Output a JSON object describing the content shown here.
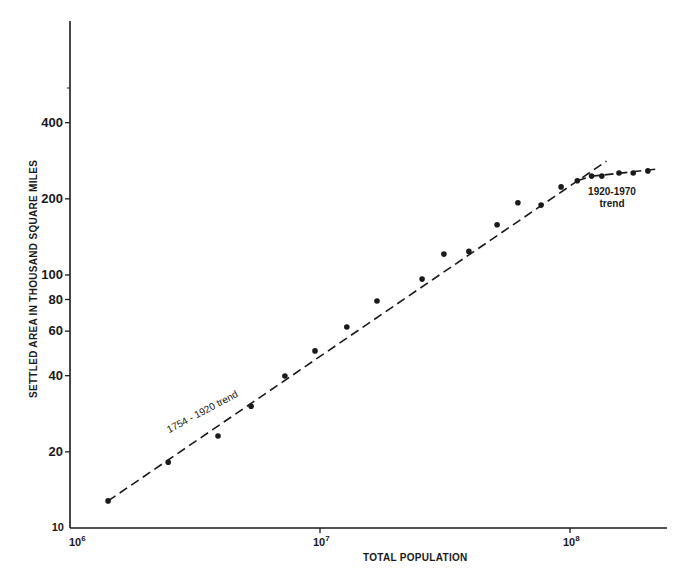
{
  "chart_data": {
    "type": "scatter",
    "title": "",
    "xlabel": "TOTAL POPULATION",
    "ylabel": "SETTLED AREA IN THOUSAND SQUARE MILES",
    "xscale": "log",
    "yscale": "log",
    "xlim": [
      1000000,
      250000000
    ],
    "ylim": [
      10,
      700
    ],
    "grid": false,
    "legend": null,
    "x_ticks": [
      {
        "value": 1000000,
        "base": "10",
        "exp": "6"
      },
      {
        "value": 10000000,
        "base": "10",
        "exp": "7"
      },
      {
        "value": 100000000,
        "base": "10",
        "exp": "8"
      }
    ],
    "y_ticks": [
      {
        "value": 10,
        "label": "10"
      },
      {
        "value": 20,
        "label": "20"
      },
      {
        "value": 40,
        "label": "40"
      },
      {
        "value": 60,
        "label": "60"
      },
      {
        "value": 80,
        "label": "80"
      },
      {
        "value": 100,
        "label": "100"
      },
      {
        "value": 200,
        "label": "200"
      },
      {
        "value": 400,
        "label": "400"
      }
    ],
    "series": [
      {
        "name": "Observations",
        "marker": "dot",
        "points": [
          {
            "x": 1420000,
            "y": 12.8
          },
          {
            "x": 2470000,
            "y": 18.2
          },
          {
            "x": 3910000,
            "y": 23.1
          },
          {
            "x": 5300000,
            "y": 30.3
          },
          {
            "x": 7240000,
            "y": 39.9
          },
          {
            "x": 9550000,
            "y": 50.1
          },
          {
            "x": 12800000,
            "y": 62.3
          },
          {
            "x": 16900000,
            "y": 78.9
          },
          {
            "x": 25600000,
            "y": 96.3
          },
          {
            "x": 31300000,
            "y": 121
          },
          {
            "x": 39400000,
            "y": 124
          },
          {
            "x": 51100000,
            "y": 158
          },
          {
            "x": 61900000,
            "y": 193
          },
          {
            "x": 76600000,
            "y": 189
          },
          {
            "x": 92100000,
            "y": 223
          },
          {
            "x": 107000000,
            "y": 236
          },
          {
            "x": 122000000,
            "y": 246
          },
          {
            "x": 134000000,
            "y": 246
          },
          {
            "x": 157000000,
            "y": 253
          },
          {
            "x": 179000000,
            "y": 253
          },
          {
            "x": 205000000,
            "y": 258
          }
        ]
      },
      {
        "name": "1754 - 1920 trend",
        "style": "dashed",
        "points": [
          {
            "x": 1420000,
            "y": 12.8
          },
          {
            "x": 140000000,
            "y": 282
          }
        ]
      },
      {
        "name": "1920-1970 trend",
        "style": "dashed",
        "points": [
          {
            "x": 107000000,
            "y": 236
          },
          {
            "x": 122000000,
            "y": 246
          },
          {
            "x": 134000000,
            "y": 248
          },
          {
            "x": 220000000,
            "y": 262
          }
        ]
      }
    ],
    "annotations": [
      {
        "text": "1754 - 1920 trend",
        "near": {
          "x": 3500000,
          "y": 28
        }
      },
      {
        "text_line1": "1920-1970",
        "text_line2": "trend",
        "near": {
          "x": 130000000,
          "y": 190
        }
      }
    ]
  },
  "labels": {
    "ylabel": "SETTLED AREA IN THOUSAND SQUARE MILES",
    "xlabel": "TOTAL POPULATION",
    "trend1": "1754 - 1920 trend",
    "trend2_line1": "1920-1970",
    "trend2_line2": "trend"
  },
  "colors": {
    "ink": "#1a1a1a",
    "background": "#ffffff"
  }
}
